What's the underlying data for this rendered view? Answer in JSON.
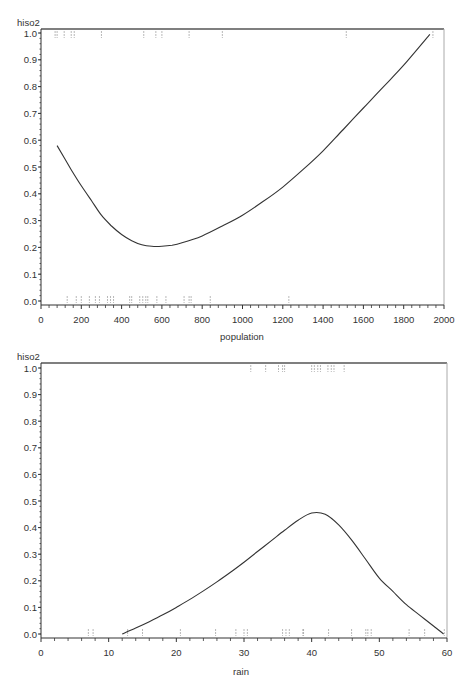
{
  "chart_data": [
    {
      "type": "line",
      "title": "",
      "ylabel": "hiso2",
      "xlabel": "population",
      "xlim": [
        0,
        2000
      ],
      "ylim": [
        0,
        1.0
      ],
      "xticks": [
        0,
        200,
        400,
        600,
        800,
        1000,
        1200,
        1400,
        1600,
        1800,
        2000
      ],
      "yticks": [
        0.0,
        0.1,
        0.2,
        0.3,
        0.4,
        0.5,
        0.6,
        0.7,
        0.8,
        0.9,
        1.0
      ],
      "ytick_labels": [
        "0.0",
        "0.1",
        "0.2",
        "0.3",
        "0.4",
        "0.5",
        "0.6",
        "0.7",
        "0.8",
        "0.9",
        "1.0"
      ],
      "grid": false,
      "series": [
        {
          "name": "fitted curve",
          "x": [
            80,
            150,
            200,
            250,
            300,
            350,
            400,
            450,
            500,
            550,
            600,
            650,
            700,
            800,
            900,
            1000,
            1100,
            1200,
            1300,
            1400,
            1500,
            1600,
            1700,
            1800,
            1930
          ],
          "y": [
            0.58,
            0.49,
            0.43,
            0.375,
            0.32,
            0.28,
            0.248,
            0.225,
            0.21,
            0.204,
            0.204,
            0.208,
            0.217,
            0.243,
            0.28,
            0.32,
            0.37,
            0.425,
            0.49,
            0.56,
            0.64,
            0.72,
            0.8,
            0.88,
            0.995
          ]
        }
      ],
      "rug_top_x": [
        70,
        80,
        115,
        150,
        165,
        300,
        510,
        570,
        600,
        735,
        900,
        1515,
        1945
      ],
      "rug_bottom_x": [
        130,
        175,
        200,
        240,
        270,
        290,
        330,
        345,
        360,
        440,
        450,
        490,
        505,
        520,
        530,
        575,
        620,
        710,
        735,
        745,
        840,
        1230
      ]
    },
    {
      "type": "line",
      "title": "",
      "ylabel": "hiso2",
      "xlabel": "rain",
      "xlim": [
        0,
        60
      ],
      "ylim": [
        0,
        1.0
      ],
      "xticks": [
        0,
        10,
        20,
        30,
        40,
        50,
        60
      ],
      "yticks": [
        0.0,
        0.1,
        0.2,
        0.3,
        0.4,
        0.5,
        0.6,
        0.7,
        0.8,
        0.9,
        1.0
      ],
      "ytick_labels": [
        "0.0",
        "0.1",
        "0.2",
        "0.3",
        "0.4",
        "0.5",
        "0.6",
        "0.7",
        "0.8",
        "0.9",
        "1.0"
      ],
      "grid": false,
      "series": [
        {
          "name": "fitted curve",
          "x": [
            12,
            14,
            16,
            18,
            20,
            22,
            24,
            26,
            28,
            30,
            32,
            34,
            36,
            38,
            40,
            42,
            44,
            46,
            48,
            50,
            52,
            54,
            56,
            58,
            59.5
          ],
          "y": [
            0.0,
            0.022,
            0.046,
            0.072,
            0.1,
            0.13,
            0.162,
            0.196,
            0.232,
            0.27,
            0.31,
            0.35,
            0.39,
            0.428,
            0.455,
            0.45,
            0.41,
            0.35,
            0.28,
            0.21,
            0.16,
            0.11,
            0.07,
            0.03,
            0.0
          ]
        }
      ],
      "rug_top_x": [
        31,
        33.2,
        35.1,
        35.7,
        36,
        40,
        40.4,
        40.9,
        41.3,
        42.4,
        42.9,
        43.3,
        44.8
      ],
      "rug_bottom_x": [
        7,
        7.7,
        12.8,
        15,
        20.6,
        25.8,
        28.8,
        30,
        30.5,
        35.7,
        36.2,
        36.7,
        38.7,
        38.8,
        42.5,
        45.9,
        48,
        48.3,
        48.8,
        54.4,
        56.7,
        59.6
      ]
    }
  ]
}
